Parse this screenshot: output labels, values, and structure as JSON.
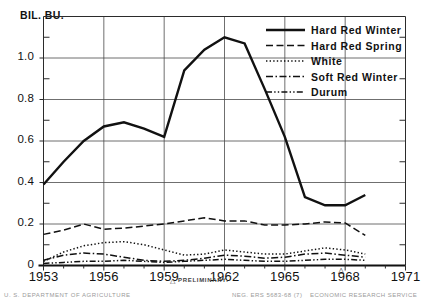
{
  "chart_data": {
    "type": "line",
    "title": "",
    "unit_label": "BIL. BU.",
    "xlabel": "",
    "ylabel": "BIL. BU.",
    "xlim": [
      1953,
      1971
    ],
    "ylim": [
      0,
      1.2
    ],
    "grid": true,
    "legend_position": "top-right",
    "yticks": [
      "0",
      "0.2",
      "0.4",
      "0.6",
      "0.8",
      "1.0"
    ],
    "ytick_values": [
      0,
      0.2,
      0.4,
      0.6,
      0.8,
      1.0
    ],
    "xticks": [
      "1953",
      "1956",
      "1959",
      "1962",
      "1965",
      "1968",
      "1971"
    ],
    "xtick_values": [
      1953,
      1956,
      1959,
      1962,
      1965,
      1968,
      1971
    ],
    "x": [
      1953,
      1954,
      1955,
      1956,
      1957,
      1958,
      1959,
      1960,
      1961,
      1962,
      1963,
      1964,
      1965,
      1966,
      1967,
      1968,
      1969
    ],
    "series": [
      {
        "name": "Hard Red Winter",
        "style": "solid",
        "values": [
          0.39,
          0.5,
          0.6,
          0.67,
          0.69,
          0.66,
          0.62,
          0.94,
          1.04,
          1.1,
          1.07,
          0.85,
          0.62,
          0.33,
          0.29,
          0.29,
          0.34
        ]
      },
      {
        "name": "Hard Red Spring",
        "style": "dashed",
        "values": [
          0.15,
          0.17,
          0.2,
          0.175,
          0.18,
          0.19,
          0.2,
          0.215,
          0.23,
          0.215,
          0.215,
          0.195,
          0.195,
          0.2,
          0.21,
          0.205,
          0.145
        ]
      },
      {
        "name": "White",
        "style": "dotted",
        "values": [
          0.02,
          0.065,
          0.095,
          0.11,
          0.115,
          0.1,
          0.075,
          0.05,
          0.055,
          0.075,
          0.065,
          0.055,
          0.055,
          0.07,
          0.085,
          0.075,
          0.055
        ]
      },
      {
        "name": "Soft Red Winter",
        "style": "dashdot",
        "values": [
          0.025,
          0.05,
          0.06,
          0.055,
          0.04,
          0.025,
          0.02,
          0.025,
          0.035,
          0.05,
          0.045,
          0.035,
          0.04,
          0.055,
          0.06,
          0.05,
          0.04
        ]
      },
      {
        "name": "Durum",
        "style": "dashdotdot",
        "values": [
          0.01,
          0.015,
          0.02,
          0.02,
          0.025,
          0.02,
          0.015,
          0.02,
          0.025,
          0.03,
          0.025,
          0.02,
          0.02,
          0.025,
          0.03,
          0.03,
          0.025
        ]
      }
    ],
    "annotations": {
      "preliminary_marker": "△",
      "preliminary_text": "PRELIMINARY."
    }
  },
  "footer": {
    "left": "U. S. DEPARTMENT OF AGRICULTURE",
    "neg": "NEG. ERS 5683-68 (7)",
    "right": "ECONOMIC RESEARCH SERVICE"
  }
}
